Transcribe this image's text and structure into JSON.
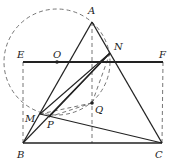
{
  "diagram": {
    "type": "geometry",
    "points": {
      "A": {
        "label": "A",
        "x": 92,
        "y": 22,
        "lx": 88,
        "ly": 14
      },
      "N": {
        "label": "N",
        "x": 110,
        "y": 53,
        "lx": 114,
        "ly": 50
      },
      "E": {
        "label": "E",
        "x": 23,
        "y": 62,
        "lx": 17,
        "ly": 58
      },
      "F": {
        "label": "F",
        "x": 163,
        "y": 62,
        "lx": 159,
        "ly": 58
      },
      "O": {
        "label": "O",
        "x": 57,
        "y": 62,
        "lx": 53,
        "ly": 58
      },
      "M": {
        "label": "M",
        "x": 40,
        "y": 114,
        "lx": 25,
        "ly": 122
      },
      "P": {
        "label": "P",
        "x": 49,
        "y": 117,
        "lx": 47,
        "ly": 128
      },
      "Q": {
        "label": "Q",
        "x": 92,
        "y": 103,
        "lx": 95,
        "ly": 113
      },
      "B": {
        "label": "B",
        "x": 23,
        "y": 143,
        "lx": 17,
        "ly": 158
      },
      "C": {
        "label": "C",
        "x": 162,
        "y": 143,
        "lx": 155,
        "ly": 158
      }
    },
    "circle": {
      "cx": 57,
      "cy": 62,
      "r": 53
    },
    "colors": {
      "stroke": "#222222",
      "dashed": "#555555"
    }
  }
}
